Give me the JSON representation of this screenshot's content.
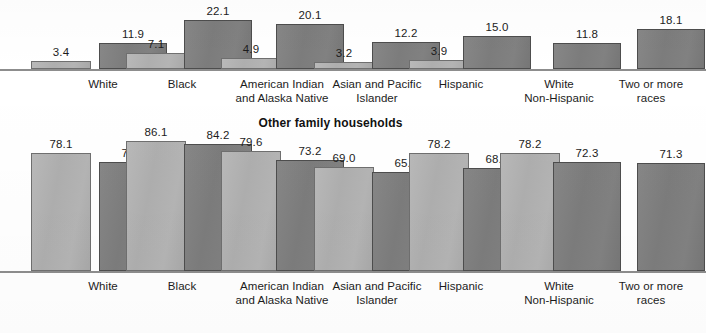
{
  "chart_data": [
    {
      "type": "bar",
      "title": "",
      "xlabel": "",
      "ylabel": "",
      "ylim": [
        0,
        23
      ],
      "grid": false,
      "legend_position": "none",
      "categories": [
        "White",
        "Black",
        "American Indian\nand Alaska Native",
        "Asian and Pacific\nIslander",
        "Hispanic",
        "White\nNon-Hispanic",
        "Two or more\nraces"
      ],
      "series": [
        {
          "name": "series-light",
          "values": [
            3.4,
            7.1,
            4.9,
            3.2,
            3.9,
            null,
            null
          ]
        },
        {
          "name": "series-dark",
          "values": [
            11.9,
            22.1,
            20.1,
            12.2,
            15.0,
            11.8,
            18.1
          ]
        }
      ]
    },
    {
      "type": "bar",
      "title": "Other family households",
      "xlabel": "",
      "ylabel": "",
      "ylim": [
        0,
        90
      ],
      "grid": false,
      "legend_position": "none",
      "categories": [
        "White",
        "Black",
        "American Indian\nand Alaska Native",
        "Asian and Pacific\nIslander",
        "Hispanic",
        "White\nNon-Hispanic",
        "Two or more\nraces"
      ],
      "series": [
        {
          "name": "series-light",
          "values": [
            78.1,
            86.1,
            79.6,
            69.0,
            78.2,
            78.2,
            null
          ]
        },
        {
          "name": "series-dark",
          "values": [
            71.9,
            84.2,
            73.2,
            65.7,
            68.3,
            72.3,
            71.3
          ]
        }
      ]
    }
  ],
  "charts": {
    "top": {
      "title": "",
      "value_labels": {
        "light": [
          "3.4",
          "7.1",
          "4.9",
          "3.2",
          "3.9",
          "",
          ""
        ],
        "dark": [
          "11.9",
          "22.1",
          "20.1",
          "12.2",
          "15.0",
          "11.8",
          "18.1"
        ]
      }
    },
    "bottom": {
      "title": "Other family households",
      "value_labels": {
        "light": [
          "78.1",
          "86.1",
          "79.6",
          "69.0",
          "78.2",
          "78.2",
          ""
        ],
        "dark": [
          "71.9",
          "84.2",
          "73.2",
          "65.7",
          "68.3",
          "72.3",
          "71.3"
        ]
      }
    },
    "categories": [
      "White",
      "Black",
      "American Indian\nand Alaska Native",
      "Asian and Pacific\nIslander",
      "Hispanic",
      "White\nNon-Hispanic",
      "Two or more\nraces"
    ]
  },
  "colors": {
    "bar_light": "#b0b0b0",
    "bar_dark": "#7e7e7e",
    "axis": "#8d8d8d",
    "text": "#1c1c1c",
    "background": "#ffffff"
  }
}
